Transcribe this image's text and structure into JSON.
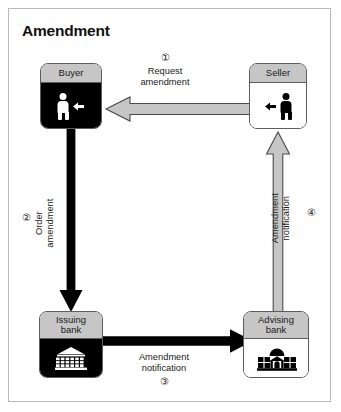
{
  "diagram": {
    "title": "Amendment",
    "nodes": [
      {
        "id": "buyer",
        "label": "Buyer",
        "icon": "person-icon",
        "secondary_icon": "arrow-left-icon",
        "style": "dark"
      },
      {
        "id": "seller",
        "label": "Seller",
        "icon": "person-icon",
        "secondary_icon": "arrow-left-icon",
        "style": "light"
      },
      {
        "id": "issuing-bank",
        "label": "Issuing\nbank",
        "icon": "bank-building-icon",
        "style": "dark"
      },
      {
        "id": "advising-bank",
        "label": "Advising\nbank",
        "icon": "bank-building-icon",
        "style": "light"
      }
    ],
    "flows": [
      {
        "step": "①",
        "number": "1",
        "label": "Request\namendment",
        "from": "seller",
        "to": "buyer",
        "direction": "left",
        "arrow_style": "gray-outlined"
      },
      {
        "step": "②",
        "number": "2",
        "label": "Order\namendment",
        "from": "buyer",
        "to": "issuing-bank",
        "direction": "down",
        "arrow_style": "solid-black"
      },
      {
        "step": "③",
        "number": "3",
        "label": "Amendment\nnotification",
        "from": "issuing-bank",
        "to": "advising-bank",
        "direction": "right",
        "arrow_style": "solid-black"
      },
      {
        "step": "④",
        "number": "4",
        "label": "Amendment\nnotification",
        "from": "advising-bank",
        "to": "seller",
        "direction": "up",
        "arrow_style": "gray-outlined"
      }
    ],
    "colors": {
      "frame_border": "#b9b9b9",
      "node_border": "#5d5d5d",
      "node_header": "#c6c6c6",
      "dark_body": "#000000",
      "light_body": "#ffffff",
      "gray_arrow_fill": "#c6c6c6",
      "gray_arrow_stroke": "#5d5d5d",
      "black_arrow_fill": "#000000",
      "text": "#1a1a1a"
    }
  }
}
